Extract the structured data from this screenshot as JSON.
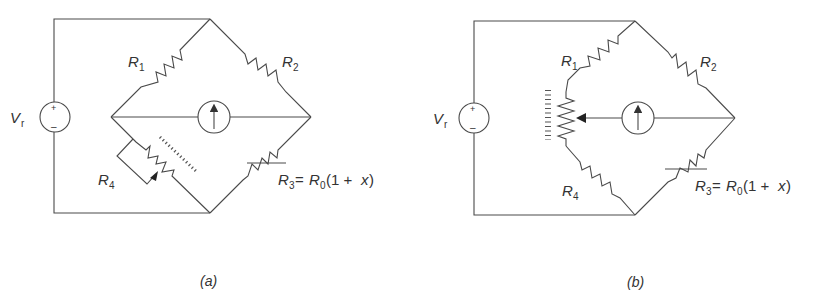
{
  "figure": {
    "panels": [
      {
        "id": "a",
        "caption": "(a)",
        "source_label": "V",
        "source_sub": "r",
        "source_plus": "+",
        "source_minus": "–",
        "r1": "R",
        "r1_sub": "1",
        "r2": "R",
        "r2_sub": "2",
        "r4": "R",
        "r4_sub": "4",
        "r3": "R",
        "r3_sub": "3",
        "r3_eq": " = ",
        "r0": "R",
        "r0_sub": "0",
        "r3_expr": "(1 + ",
        "x": "x",
        "close": ")"
      },
      {
        "id": "b",
        "caption": "(b)",
        "source_label": "V",
        "source_sub": "r",
        "source_plus": "+",
        "source_minus": "–",
        "r1": "R",
        "r1_sub": "1",
        "r2": "R",
        "r2_sub": "2",
        "r4": "R",
        "r4_sub": "4",
        "r3": "R",
        "r3_sub": "3",
        "r3_eq": " = ",
        "r0": "R",
        "r0_sub": "0",
        "r3_expr": "(1 + ",
        "x": "x",
        "close": ")"
      }
    ]
  }
}
